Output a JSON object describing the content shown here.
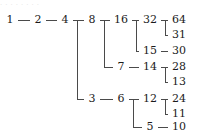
{
  "figure": {
    "background_color": "#ffffff",
    "line_color": "#4a4a4a",
    "text_color": "#1b1b1b",
    "top_artifact_text": "· · ·   · ·  · · ·"
  },
  "chart_data": {
    "type": "diagram",
    "subtype": "binary-tree",
    "title": "",
    "orientation": "left-to-right",
    "columns": 7,
    "rows": 7,
    "nodes": [
      {
        "id": "n1",
        "label": "1",
        "col": 1,
        "row": 1
      },
      {
        "id": "n2",
        "label": "2",
        "col": 2,
        "row": 1
      },
      {
        "id": "n4",
        "label": "4",
        "col": 3,
        "row": 1
      },
      {
        "id": "n8",
        "label": "8",
        "col": 4,
        "row": 1
      },
      {
        "id": "n16",
        "label": "16",
        "col": 5,
        "row": 1
      },
      {
        "id": "n32",
        "label": "32",
        "col": 6,
        "row": 1
      },
      {
        "id": "n64",
        "label": "64",
        "col": 7,
        "row": 1
      },
      {
        "id": "n31",
        "label": "31",
        "col": 7,
        "row": 2
      },
      {
        "id": "n15",
        "label": "15",
        "col": 6,
        "row": 3
      },
      {
        "id": "n30",
        "label": "30",
        "col": 7,
        "row": 3
      },
      {
        "id": "n7",
        "label": "7",
        "col": 5,
        "row": 4
      },
      {
        "id": "n14",
        "label": "14",
        "col": 6,
        "row": 4
      },
      {
        "id": "n28",
        "label": "28",
        "col": 7,
        "row": 4
      },
      {
        "id": "n13",
        "label": "13",
        "col": 7,
        "row": 5
      },
      {
        "id": "n3",
        "label": "3",
        "col": 4,
        "row": 6
      },
      {
        "id": "n6",
        "label": "6",
        "col": 5,
        "row": 6
      },
      {
        "id": "n12",
        "label": "12",
        "col": 6,
        "row": 6
      },
      {
        "id": "n24",
        "label": "24",
        "col": 7,
        "row": 6
      },
      {
        "id": "n11",
        "label": "11",
        "col": 7,
        "row": 7
      },
      {
        "id": "n5",
        "label": "5",
        "col": 6,
        "row": 8
      },
      {
        "id": "n10",
        "label": "10",
        "col": 7,
        "row": 8
      }
    ],
    "edges": [
      {
        "from": "n1",
        "to": "n2"
      },
      {
        "from": "n2",
        "to": "n4"
      },
      {
        "from": "n4",
        "to": "n8"
      },
      {
        "from": "n4",
        "to": "n3"
      },
      {
        "from": "n8",
        "to": "n16"
      },
      {
        "from": "n8",
        "to": "n7"
      },
      {
        "from": "n16",
        "to": "n32"
      },
      {
        "from": "n16",
        "to": "n15"
      },
      {
        "from": "n32",
        "to": "n64"
      },
      {
        "from": "n32",
        "to": "n31"
      },
      {
        "from": "n15",
        "to": "n30"
      },
      {
        "from": "n7",
        "to": "n14"
      },
      {
        "from": "n14",
        "to": "n28"
      },
      {
        "from": "n14",
        "to": "n13"
      },
      {
        "from": "n3",
        "to": "n6"
      },
      {
        "from": "n6",
        "to": "n12"
      },
      {
        "from": "n6",
        "to": "n5"
      },
      {
        "from": "n12",
        "to": "n24"
      },
      {
        "from": "n12",
        "to": "n11"
      },
      {
        "from": "n5",
        "to": "n10"
      }
    ],
    "column_x": [
      10,
      38,
      65,
      92,
      121,
      150,
      179
    ],
    "row_y": [
      20,
      35,
      51,
      67,
      82,
      99,
      114,
      127
    ]
  }
}
